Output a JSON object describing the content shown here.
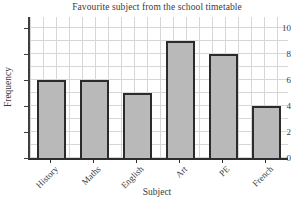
{
  "title": "Favourite subject from the school timetable",
  "chart_data": {
    "type": "bar",
    "categories": [
      "History",
      "Maths",
      "English",
      "Art",
      "PE",
      "French"
    ],
    "values": [
      6,
      6,
      5,
      9,
      8,
      4
    ],
    "title": "Favourite subject from the school timetable",
    "xlabel": "Subject",
    "ylabel": "Frequency",
    "ylim": [
      0,
      10.8
    ],
    "yticks": [
      0,
      2,
      4,
      6,
      8,
      10
    ],
    "grid": "on",
    "legend": "none",
    "bar_fill_color": "#b9b9b9",
    "bar_edge_color": "#2b2b2b",
    "grid_color": "#d7d7d7"
  }
}
